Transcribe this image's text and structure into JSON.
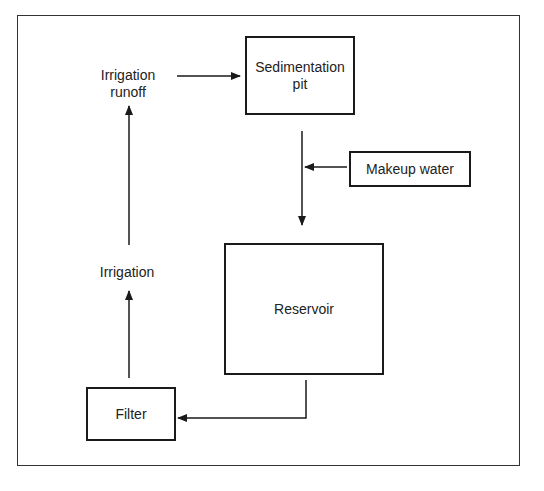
{
  "diagram": {
    "type": "flowchart",
    "nodes": {
      "sedimentation_pit": {
        "label_line1": "Sedimentation",
        "label_line2": "pit",
        "shape": "box"
      },
      "makeup_water": {
        "label": "Makeup water",
        "shape": "box"
      },
      "reservoir": {
        "label": "Reservoir",
        "shape": "box"
      },
      "filter": {
        "label": "Filter",
        "shape": "box"
      },
      "irrigation": {
        "label": "Irrigation",
        "shape": "text"
      },
      "irrigation_runoff": {
        "label_line1": "Irrigation",
        "label_line2": "runoff",
        "shape": "text"
      }
    },
    "edges": [
      {
        "from": "Irrigation runoff",
        "to": "Sedimentation pit"
      },
      {
        "from": "Sedimentation pit",
        "to": "Reservoir"
      },
      {
        "from": "Makeup water",
        "to": "Sedimentation pit → Reservoir line"
      },
      {
        "from": "Reservoir",
        "to": "Filter"
      },
      {
        "from": "Filter",
        "to": "Irrigation"
      },
      {
        "from": "Irrigation",
        "to": "Irrigation runoff"
      }
    ],
    "colors": {
      "line": "#1a1a1a",
      "background": "#ffffff",
      "text": "#222222"
    }
  }
}
